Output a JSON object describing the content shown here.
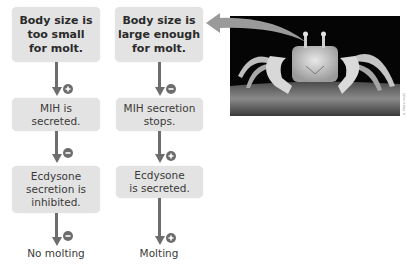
{
  "diagram": {
    "colors": {
      "box_fill": "#e3e3e3",
      "arrow": "#6d6d6d",
      "text": "#3a3a3a"
    },
    "columns": [
      {
        "id": "left",
        "nodes": [
          {
            "label": "Body size is\ntoo small\nfor molt.",
            "bold": true
          },
          {
            "label": "MIH is\nsecreted.",
            "bold": false
          },
          {
            "label": "Ecdysone\nsecretion is\ninhibited.",
            "bold": false
          }
        ],
        "arrow_signs": [
          "+",
          "−",
          "−"
        ],
        "outcome": "No molting"
      },
      {
        "id": "right",
        "nodes": [
          {
            "label": "Body size is\nlarge enough\nfor molt.",
            "bold": true
          },
          {
            "label": "MIH secretion\nstops.",
            "bold": false
          },
          {
            "label": "Ecdysone\nis secreted.",
            "bold": false
          }
        ],
        "arrow_signs": [
          "−",
          "+",
          "+"
        ],
        "outcome": "Molting"
      }
    ],
    "photo": {
      "subject": "Ghost crab photographed at night on sand",
      "arrow_target": "right.nodes.0",
      "credit": "© Photo credit"
    }
  }
}
